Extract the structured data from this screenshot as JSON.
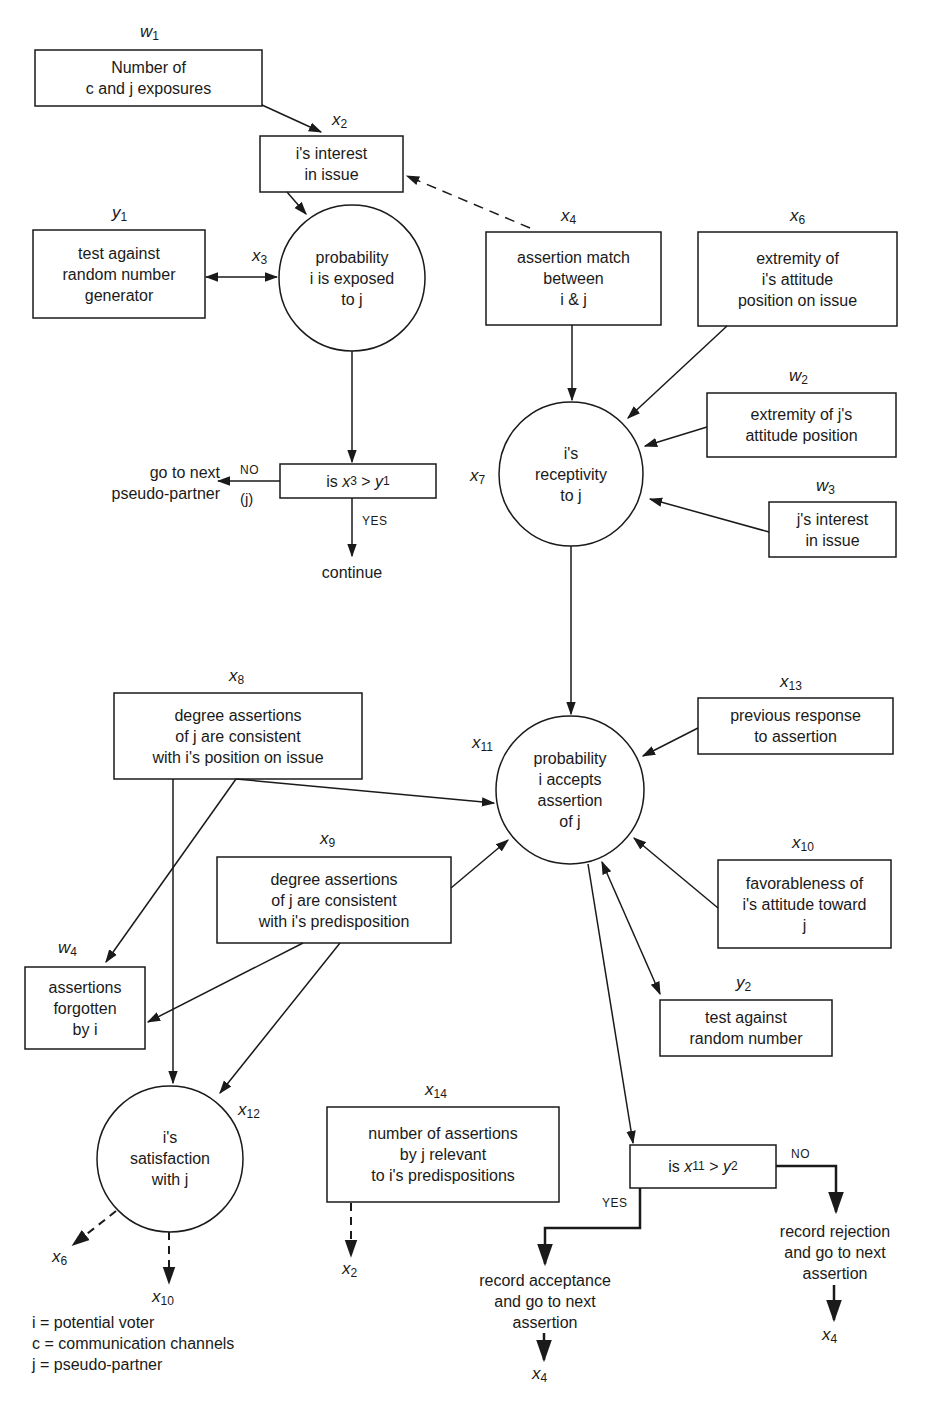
{
  "diagram": {
    "title": "",
    "nodes": [
      {
        "id": "w1",
        "label": "w",
        "sub": "1",
        "shape": "box",
        "text": "Number of\nc and j exposures"
      },
      {
        "id": "x2",
        "label": "x",
        "sub": "2",
        "shape": "box",
        "text": "i's interest\nin issue"
      },
      {
        "id": "y1",
        "label": "y",
        "sub": "1",
        "shape": "box",
        "text": "test against\nrandom number\ngenerator"
      },
      {
        "id": "x3",
        "label": "x",
        "sub": "3",
        "shape": "circle",
        "text": "probability\ni is exposed\nto j"
      },
      {
        "id": "x4",
        "label": "x",
        "sub": "4",
        "shape": "box",
        "text": "assertion match\nbetween\ni & j"
      },
      {
        "id": "x6",
        "label": "x",
        "sub": "6",
        "shape": "box",
        "text": "extremity of\ni's attitude\nposition on issue"
      },
      {
        "id": "w2",
        "label": "w",
        "sub": "2",
        "shape": "box",
        "text": "extremity of j's\nattitude position"
      },
      {
        "id": "w3",
        "label": "w",
        "sub": "3",
        "shape": "box",
        "text": "j's interest\nin issue"
      },
      {
        "id": "x7",
        "label": "x",
        "sub": "7",
        "shape": "circle",
        "text": "i's\nreceptivity\nto j"
      },
      {
        "id": "x8",
        "label": "x",
        "sub": "8",
        "shape": "box",
        "text": "degree assertions\nof j are consistent\nwith i's position on issue"
      },
      {
        "id": "x11",
        "label": "x",
        "sub": "11",
        "shape": "circle",
        "text": "probability\ni accepts\nassertion\nof j"
      },
      {
        "id": "x13",
        "label": "x",
        "sub": "13",
        "shape": "box",
        "text": "previous response\nto assertion"
      },
      {
        "id": "x9",
        "label": "x",
        "sub": "9",
        "shape": "box",
        "text": "degree assertions\nof j are consistent\nwith i's predisposition"
      },
      {
        "id": "x10",
        "label": "x",
        "sub": "10",
        "shape": "box",
        "text": "favorableness of\ni's attitude toward\nj"
      },
      {
        "id": "w4",
        "label": "w",
        "sub": "4",
        "shape": "box",
        "text": "assertions\nforgotten\nby i"
      },
      {
        "id": "y2",
        "label": "y",
        "sub": "2",
        "shape": "box",
        "text": "test against\nrandom number"
      },
      {
        "id": "x12",
        "label": "x",
        "sub": "12",
        "shape": "circle",
        "text": "i's\nsatisfaction\nwith j"
      },
      {
        "id": "x14",
        "label": "x",
        "sub": "14",
        "shape": "box",
        "text": "number of assertions\nby j relevant\nto i's predispositions"
      }
    ],
    "decisions": [
      {
        "id": "d1",
        "prefix": "is ",
        "left": "x",
        "left_sub": "3",
        "op": " > ",
        "right": "y",
        "right_sub": "1",
        "no_label": "NO",
        "no_sub": "(j)",
        "no_text": "go to next\npseudo-partner",
        "yes_label": "YES",
        "yes_text": "continue"
      },
      {
        "id": "d2",
        "prefix": "is ",
        "left": "x",
        "left_sub": "11",
        "op": " > ",
        "right": "y",
        "right_sub": "2",
        "no_label": "NO",
        "no_text": "record rejection\nand go to next\nassertion",
        "no_target": {
          "label": "x",
          "sub": "4"
        },
        "yes_label": "YES",
        "yes_text": "record acceptance\nand go to next\nassertion",
        "yes_target": {
          "label": "x",
          "sub": "4"
        }
      }
    ],
    "terminal_labels": [
      {
        "id": "t-x6",
        "label": "x",
        "sub": "6"
      },
      {
        "id": "t-x10",
        "label": "x",
        "sub": "10"
      },
      {
        "id": "t-x2",
        "label": "x",
        "sub": "2"
      }
    ],
    "legend": [
      "i = potential voter",
      "c = communication channels",
      "j = pseudo-partner"
    ],
    "edges": [
      {
        "from": "w1",
        "to": "x2",
        "style": "solid"
      },
      {
        "from": "x4",
        "to": "x2",
        "style": "dashed"
      },
      {
        "from": "x2",
        "to": "x3",
        "style": "solid"
      },
      {
        "from": "y1",
        "to": "x3",
        "style": "solid-bidirectional"
      },
      {
        "from": "x3",
        "to": "d1",
        "style": "solid"
      },
      {
        "from": "x4",
        "to": "x7",
        "style": "solid"
      },
      {
        "from": "x6",
        "to": "x7",
        "style": "solid"
      },
      {
        "from": "w2",
        "to": "x7",
        "style": "solid"
      },
      {
        "from": "w3",
        "to": "x7",
        "style": "solid"
      },
      {
        "from": "x7",
        "to": "x11",
        "style": "solid"
      },
      {
        "from": "x13",
        "to": "x11",
        "style": "solid"
      },
      {
        "from": "x8",
        "to": "x11",
        "style": "solid"
      },
      {
        "from": "x9",
        "to": "x11",
        "style": "solid"
      },
      {
        "from": "x10",
        "to": "x11",
        "style": "solid"
      },
      {
        "from": "x11",
        "to": "y2",
        "style": "solid-bidirectional"
      },
      {
        "from": "x11",
        "to": "d2",
        "style": "solid"
      },
      {
        "from": "x8",
        "to": "w4",
        "style": "solid"
      },
      {
        "from": "x8",
        "to": "x12",
        "style": "solid"
      },
      {
        "from": "x9",
        "to": "w4",
        "style": "solid"
      },
      {
        "from": "x9",
        "to": "x12",
        "style": "solid"
      },
      {
        "from": "x12",
        "to": "x6",
        "style": "dashed"
      },
      {
        "from": "x12",
        "to": "x10",
        "style": "dashed"
      },
      {
        "from": "x14",
        "to": "x2",
        "style": "dashed"
      }
    ],
    "colors": {
      "ink": "#1a1a1a",
      "background": "#ffffff"
    }
  }
}
